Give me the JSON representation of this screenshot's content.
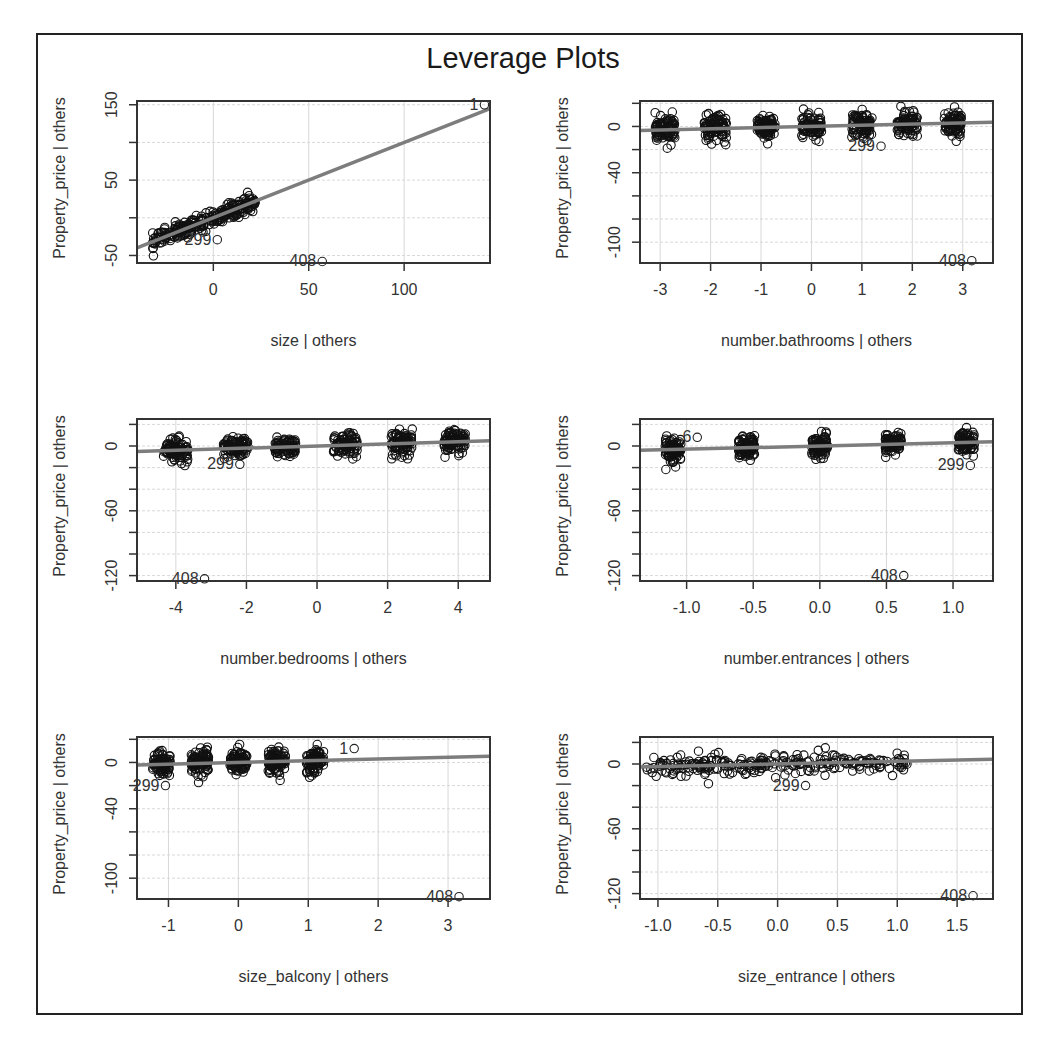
{
  "chart_data": {
    "type": "scatter",
    "title": "Leverage Plots",
    "layout": {
      "rows": 3,
      "cols": 2
    },
    "panels": [
      {
        "id": "size",
        "xlabel": "size | others",
        "ylabel": "Property_price  | others",
        "xlim": [
          -40,
          145
        ],
        "ylim": [
          -60,
          155
        ],
        "xticks": [
          0,
          50,
          100
        ],
        "yticks": [
          -50,
          50,
          150
        ],
        "ygrid": [
          -50,
          0,
          50,
          100,
          150
        ],
        "fit_line": {
          "slope": 1.0,
          "intercept": 0,
          "x0": -40,
          "x1": 145
        },
        "clusters": [
          {
            "xmin": -32,
            "xmax": 22,
            "trend": 1.0,
            "spread": 10
          }
        ],
        "labeled_points": [
          {
            "label": "1",
            "x": 140,
            "y": 150
          },
          {
            "label": "299",
            "x": 0,
            "y": -29
          },
          {
            "label": "408",
            "x": 55,
            "y": -58
          }
        ]
      },
      {
        "id": "number.bathrooms",
        "xlabel": "number.bathrooms | others",
        "ylabel": "Property_price  | others",
        "xlim": [
          -3.4,
          3.6
        ],
        "ylim": [
          -118,
          22
        ],
        "xticks": [
          -3,
          -2,
          -1,
          0,
          1,
          2,
          3
        ],
        "yticks": [
          0,
          -40,
          -100
        ],
        "ygrid": [
          20,
          0,
          -20,
          -40,
          -60,
          -80,
          -100
        ],
        "fit_line": {
          "slope": 1.0,
          "intercept": 0,
          "x0": -3.4,
          "x1": 3.6
        },
        "clusters": [
          {
            "center": -2.9,
            "width": 0.4,
            "spread": 10
          },
          {
            "center": -1.9,
            "width": 0.45,
            "spread": 10
          },
          {
            "center": -0.9,
            "width": 0.35,
            "spread": 9
          },
          {
            "center": 0.0,
            "width": 0.4,
            "spread": 9
          },
          {
            "center": 1.0,
            "width": 0.4,
            "spread": 10
          },
          {
            "center": 1.9,
            "width": 0.4,
            "spread": 9
          },
          {
            "center": 2.8,
            "width": 0.35,
            "spread": 10
          }
        ],
        "labeled_points": [
          {
            "label": "299",
            "x": 1.3,
            "y": -17
          },
          {
            "label": "408",
            "x": 3.1,
            "y": -116
          }
        ]
      },
      {
        "id": "number.bedrooms",
        "xlabel": "number.bedrooms | others",
        "ylabel": "Property_price  | others",
        "xlim": [
          -5.1,
          4.9
        ],
        "ylim": [
          -125,
          25
        ],
        "xticks": [
          -4,
          -2,
          0,
          2,
          4
        ],
        "yticks": [
          0,
          -60,
          -120
        ],
        "ygrid": [
          20,
          0,
          -20,
          -40,
          -60,
          -80,
          -100,
          -120
        ],
        "fit_line": {
          "slope": 1.0,
          "intercept": 0,
          "x0": -5.1,
          "x1": 4.9
        },
        "clusters": [
          {
            "center": -4.0,
            "width": 0.7,
            "spread": 10
          },
          {
            "center": -2.3,
            "width": 0.7,
            "spread": 9
          },
          {
            "center": -0.9,
            "width": 0.6,
            "spread": 8
          },
          {
            "center": 0.8,
            "width": 0.7,
            "spread": 9
          },
          {
            "center": 2.4,
            "width": 0.6,
            "spread": 11
          },
          {
            "center": 3.9,
            "width": 0.6,
            "spread": 9
          }
        ],
        "labeled_points": [
          {
            "label": "299",
            "x": -2.3,
            "y": -17
          },
          {
            "label": "408",
            "x": -3.3,
            "y": -123
          }
        ]
      },
      {
        "id": "number.entrances",
        "xlabel": "number.entrances | others",
        "ylabel": "Property_price  | others",
        "xlim": [
          -1.35,
          1.3
        ],
        "ylim": [
          -125,
          25
        ],
        "xticks": [
          -1.0,
          -0.5,
          0.0,
          0.5,
          1.0
        ],
        "xtick_labels": [
          "-1.0",
          "-0.5",
          "0.0",
          "0.5",
          "1.0"
        ],
        "yticks": [
          0,
          -60,
          -120
        ],
        "ygrid": [
          20,
          0,
          -20,
          -40,
          -60,
          -80,
          -100,
          -120
        ],
        "fit_line": {
          "slope": 3.0,
          "intercept": 0,
          "x0": -1.35,
          "x1": 1.3
        },
        "clusters": [
          {
            "center": -1.1,
            "width": 0.12,
            "spread": 10
          },
          {
            "center": -0.55,
            "width": 0.12,
            "spread": 10
          },
          {
            "center": 0.0,
            "width": 0.12,
            "spread": 9
          },
          {
            "center": 0.55,
            "width": 0.12,
            "spread": 9
          },
          {
            "center": 1.1,
            "width": 0.12,
            "spread": 10
          }
        ],
        "labeled_points": [
          {
            "label": "6",
            "x": -0.95,
            "y": 8
          },
          {
            "label": "299",
            "x": 1.1,
            "y": -18
          },
          {
            "label": "408",
            "x": 0.6,
            "y": -120
          }
        ]
      },
      {
        "id": "size_balcony",
        "xlabel": "size_balcony | others",
        "ylabel": "Property_price  | others",
        "xlim": [
          -1.45,
          3.6
        ],
        "ylim": [
          -118,
          22
        ],
        "xticks": [
          -1,
          0,
          1,
          2,
          3
        ],
        "yticks": [
          0,
          -40,
          -100
        ],
        "ygrid": [
          20,
          0,
          -20,
          -40,
          -60,
          -80,
          -100
        ],
        "fit_line": {
          "slope": 1.5,
          "intercept": 0,
          "x0": -1.45,
          "x1": 3.6
        },
        "clusters": [
          {
            "center": -1.1,
            "width": 0.25,
            "spread": 10
          },
          {
            "center": -0.55,
            "width": 0.25,
            "spread": 10
          },
          {
            "center": 0.0,
            "width": 0.25,
            "spread": 9
          },
          {
            "center": 0.55,
            "width": 0.25,
            "spread": 9
          },
          {
            "center": 1.1,
            "width": 0.25,
            "spread": 10
          }
        ],
        "labeled_points": [
          {
            "label": "1",
            "x": 1.6,
            "y": 12
          },
          {
            "label": "299",
            "x": -1.1,
            "y": -20
          },
          {
            "label": "408",
            "x": 3.1,
            "y": -116
          }
        ]
      },
      {
        "id": "size_entrance",
        "xlabel": "size_entrance | others",
        "ylabel": "Property_price  | others",
        "xlim": [
          -1.15,
          1.8
        ],
        "ylim": [
          -125,
          25
        ],
        "xticks": [
          -1.0,
          -0.5,
          0.0,
          0.5,
          1.0,
          1.5
        ],
        "xtick_labels": [
          "-1.0",
          "-0.5",
          "0.0",
          "0.5",
          "1.0",
          "1.5"
        ],
        "yticks": [
          0,
          -60,
          -120
        ],
        "ygrid": [
          20,
          0,
          -20,
          -40,
          -60,
          -80,
          -100,
          -120
        ],
        "fit_line": {
          "slope": 2.5,
          "intercept": 0,
          "x0": -1.15,
          "x1": 1.8
        },
        "clusters": [
          {
            "xmin": -1.1,
            "xmax": 1.1,
            "trend": 2.5,
            "spread": 9
          }
        ],
        "labeled_points": [
          {
            "label": "299",
            "x": 0.2,
            "y": -20
          },
          {
            "label": "408",
            "x": 1.6,
            "y": -122
          }
        ]
      }
    ]
  },
  "figure": {
    "title": "Leverage Plots"
  }
}
